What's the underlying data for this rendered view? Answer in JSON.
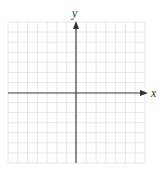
{
  "graph": {
    "x_axis_label": "x",
    "y_axis_label": "y",
    "grid_cells_x": 14,
    "grid_cells_y": 14,
    "x_range": [
      -7,
      7
    ],
    "y_range": [
      -7,
      7
    ],
    "colors": {
      "grid_line": "#e6e6e6",
      "axis_line": "#444444",
      "background": "#ffffff"
    }
  }
}
